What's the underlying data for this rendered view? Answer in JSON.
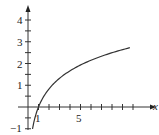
{
  "chart_data": {
    "type": "line",
    "title": "",
    "xlabel": "x",
    "ylabel": "",
    "xlim": [
      -0.5,
      11.5
    ],
    "ylim": [
      -1.2,
      4.5
    ],
    "x_ticks_every": 1,
    "y_ticks_every": 0.5,
    "x_tick_labels": [
      {
        "value": 1,
        "label": "1"
      },
      {
        "value": 5,
        "label": "5"
      }
    ],
    "y_tick_labels": [
      {
        "value": -1,
        "label": "−1"
      },
      {
        "value": 1,
        "label": "1"
      },
      {
        "value": 2,
        "label": "2"
      },
      {
        "value": 3,
        "label": "3"
      },
      {
        "value": 4,
        "label": "4"
      }
    ],
    "grid": false,
    "series": [
      {
        "name": "f(x)",
        "description": "logarithmic curve crossing x-axis at x=1",
        "x": [
          0.43,
          0.5,
          0.6,
          0.7,
          0.8,
          1,
          1.5,
          2,
          3,
          4,
          5,
          6,
          7,
          8,
          9,
          9.7
        ],
        "y": [
          -1.0,
          -0.83,
          -0.61,
          -0.43,
          -0.27,
          0,
          0.49,
          0.83,
          1.32,
          1.66,
          1.93,
          2.15,
          2.34,
          2.5,
          2.64,
          2.73
        ]
      }
    ]
  },
  "labels": {
    "x_axis": "x",
    "tick_1": "1",
    "tick_5": "5",
    "y_4": "4",
    "y_3": "3",
    "y_2": "2",
    "y_1": "1",
    "y_neg1": "−1"
  }
}
